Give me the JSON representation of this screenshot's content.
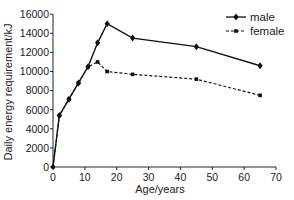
{
  "chart_data": {
    "type": "line",
    "title": "",
    "xlabel": "Age/years",
    "ylabel": "Daily energy requirement/kJ",
    "xlim": [
      0,
      70
    ],
    "ylim": [
      0,
      16000
    ],
    "xticks": [
      0,
      10,
      20,
      30,
      40,
      50,
      60,
      70
    ],
    "yticks": [
      0,
      2000,
      4000,
      6000,
      8000,
      10000,
      12000,
      14000,
      16000
    ],
    "grid": false,
    "legend_position": "top-right",
    "series": [
      {
        "name": "male",
        "style": "solid",
        "marker": "diamond",
        "color": "#111111",
        "x": [
          0,
          2,
          5,
          8,
          11,
          14,
          17,
          25,
          45,
          65
        ],
        "y": [
          0,
          5400,
          7100,
          8800,
          10500,
          13000,
          15000,
          13500,
          12600,
          10600
        ]
      },
      {
        "name": "female",
        "style": "dashed",
        "marker": "square",
        "color": "#111111",
        "x": [
          0,
          2,
          5,
          8,
          11,
          14,
          17,
          25,
          45,
          65
        ],
        "y": [
          0,
          5400,
          7100,
          8800,
          10500,
          11000,
          10000,
          9700,
          9200,
          7500
        ]
      }
    ]
  },
  "legend": {
    "items": [
      {
        "label": "male"
      },
      {
        "label": "female"
      }
    ]
  },
  "axes": {
    "xlabel": "Age/years",
    "ylabel": "Daily energy requirement/kJ"
  }
}
